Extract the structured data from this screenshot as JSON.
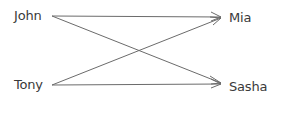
{
  "diagram": {
    "left_nodes": [
      {
        "label": "John",
        "x": 14,
        "y": 8,
        "anchor": [
          52,
          16
        ]
      },
      {
        "label": "Tony",
        "x": 14,
        "y": 77,
        "anchor": [
          52,
          85
        ]
      }
    ],
    "right_nodes": [
      {
        "label": "Mia",
        "x": 229,
        "y": 10,
        "anchor": [
          221,
          17
        ]
      },
      {
        "label": "Sasha",
        "x": 229,
        "y": 79,
        "anchor": [
          221,
          84
        ]
      }
    ],
    "edges": [
      {
        "from": "John",
        "to": "Mia"
      },
      {
        "from": "John",
        "to": "Sasha"
      },
      {
        "from": "Tony",
        "to": "Mia"
      },
      {
        "from": "Tony",
        "to": "Sasha"
      }
    ],
    "line_color": "#6b6b6b"
  }
}
